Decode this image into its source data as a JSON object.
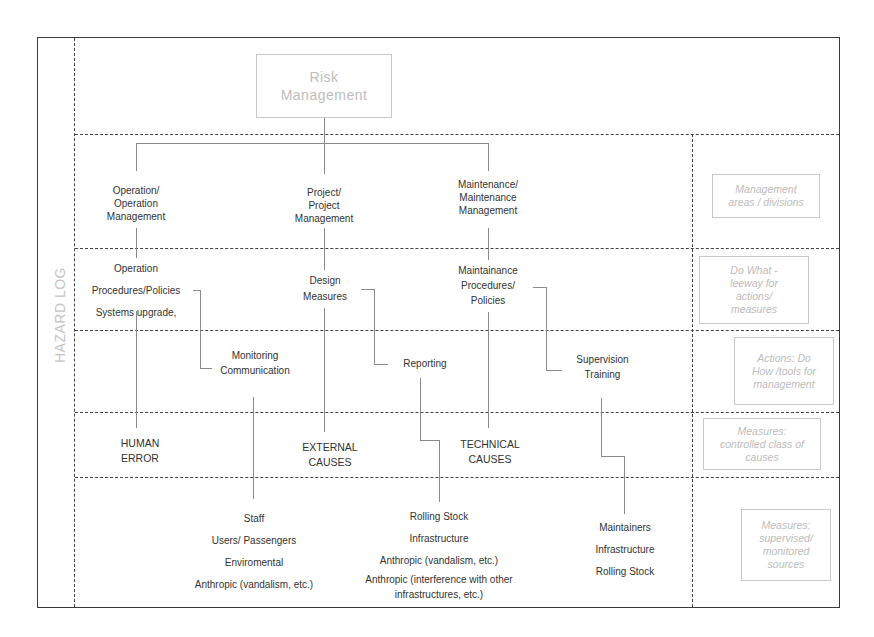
{
  "side_label": "HAZARD LOG",
  "root": {
    "lines": [
      "Risk",
      "Management"
    ]
  },
  "level1": [
    {
      "lines": [
        "Operation/",
        "Operation",
        "Management"
      ]
    },
    {
      "lines": [
        "Project/",
        "Project",
        "Management"
      ]
    },
    {
      "lines": [
        "Maintenance/",
        "Maintenance",
        "Management"
      ]
    }
  ],
  "level2": [
    {
      "lines": [
        "Operation",
        "Procedures/Policies",
        "Systems upgrade,"
      ]
    },
    {
      "lines": [
        "Design",
        "Measures"
      ]
    },
    {
      "lines": [
        "Maintainance",
        "Procedures/",
        "Policies"
      ]
    }
  ],
  "level3": [
    {
      "lines": [
        "Monitoring",
        "Communication"
      ]
    },
    {
      "lines": [
        "Reporting"
      ]
    },
    {
      "lines": [
        "Supervision",
        "Training"
      ]
    }
  ],
  "level4": [
    {
      "lines": [
        "HUMAN",
        "ERROR"
      ]
    },
    {
      "lines": [
        "EXTERNAL",
        "CAUSES"
      ]
    },
    {
      "lines": [
        "TECHNICAL",
        "CAUSES"
      ]
    }
  ],
  "level5": [
    {
      "lines": [
        "Staff",
        "Users/ Passengers",
        "Enviromental",
        "Anthropic (vandalism,  etc.)"
      ]
    },
    {
      "lines": [
        "Rolling Stock",
        "Infrastructure",
        "Anthropic (vandalism,  etc.)",
        "Anthropic (interference  with other",
        "infrastructures,  etc.)"
      ]
    },
    {
      "lines": [
        "Maintainers",
        "Infrastructure",
        "Rolling Stock"
      ]
    }
  ],
  "legend": [
    {
      "lines": [
        "Management",
        "areas / divisions"
      ]
    },
    {
      "lines": [
        "Do What -",
        "leeway for",
        "actions/",
        "measures"
      ]
    },
    {
      "lines": [
        "Actions: Do",
        "How /tools for",
        "management"
      ]
    },
    {
      "lines": [
        "Measures:",
        "controlled class of",
        "causes"
      ]
    },
    {
      "lines": [
        "Measures:",
        "supervised/",
        "monitored",
        "sources"
      ]
    }
  ],
  "colors": {
    "frame": "#3a3a3a",
    "connector": "#8a8a8a",
    "faded_text": "#bdbdbd",
    "text": "#333333"
  }
}
